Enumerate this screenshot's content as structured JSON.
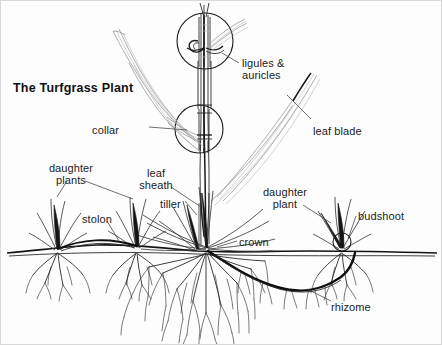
{
  "figure": {
    "title": "The Turfgrass Plant",
    "background_color": "#fdfdfd",
    "ink_color": "#1a1a1a",
    "border_color": "#d8d8d8",
    "width": 442,
    "height": 345
  },
  "labels": [
    {
      "id": "ligules-auricles",
      "text": "ligules &\nauricles",
      "align": "left",
      "x": 241,
      "y": 56
    },
    {
      "id": "collar",
      "text": "collar",
      "align": "right",
      "x": 118,
      "y": 123
    },
    {
      "id": "leaf-blade",
      "text": "leaf blade",
      "align": "left",
      "x": 312,
      "y": 124
    },
    {
      "id": "daughter-plants",
      "text": "daughter\nplants",
      "align": "center",
      "x": 70,
      "y": 161
    },
    {
      "id": "leaf-sheath",
      "text": "leaf\nsheath",
      "align": "center",
      "x": 155,
      "y": 166
    },
    {
      "id": "tiller",
      "text": "tiller",
      "align": "left",
      "x": 159,
      "y": 197
    },
    {
      "id": "stolon",
      "text": "stolon",
      "align": "left",
      "x": 81,
      "y": 212
    },
    {
      "id": "daughter-plant",
      "text": "daughter\nplant",
      "align": "center",
      "x": 284,
      "y": 185
    },
    {
      "id": "budshoot",
      "text": "budshoot",
      "align": "left",
      "x": 357,
      "y": 209
    },
    {
      "id": "crown",
      "text": "crown",
      "align": "left",
      "x": 238,
      "y": 235
    },
    {
      "id": "rhizome",
      "text": "rhizome",
      "align": "left",
      "x": 330,
      "y": 300
    }
  ],
  "parts": [
    {
      "name": "leaf-blade",
      "description": "long tapering grass leaves fanning from the shoot"
    },
    {
      "name": "leaf-sheath",
      "description": "tubular base of the leaf wrapping the stem"
    },
    {
      "name": "collar",
      "description": "junction of blade and sheath, shown magnified"
    },
    {
      "name": "ligule-auricle",
      "description": "membranous ligule and clasping auricles, shown magnified"
    },
    {
      "name": "crown",
      "description": "basal growing point at the soil surface"
    },
    {
      "name": "tiller",
      "description": "secondary shoot arising from the crown"
    },
    {
      "name": "stolon",
      "description": "above-ground horizontal stem forming daughter plants"
    },
    {
      "name": "rhizome",
      "description": "below-ground horizontal stem forming daughter plants"
    },
    {
      "name": "budshoot",
      "description": "new shoot emerging at a rhizome node"
    },
    {
      "name": "root-system",
      "description": "dense fibrous roots below the crown"
    }
  ],
  "magnifiers": [
    {
      "id": "ligule-magnifier",
      "cx": 204,
      "cy": 40,
      "r": 28
    },
    {
      "id": "collar-magnifier",
      "cx": 198,
      "cy": 128,
      "r": 24
    }
  ],
  "soil_line": {
    "id": "soil-surface",
    "y": 250
  }
}
